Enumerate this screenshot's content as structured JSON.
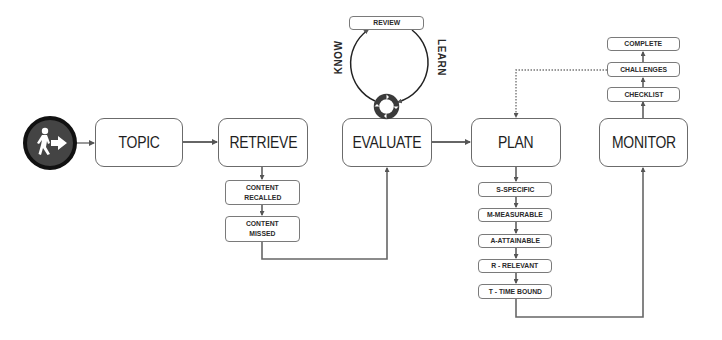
{
  "diagram": {
    "start": {
      "icon": "person-walking-exit-icon"
    },
    "main_steps": [
      {
        "id": "topic",
        "label": "TOPIC"
      },
      {
        "id": "retrieve",
        "label": "RETRIEVE"
      },
      {
        "id": "evaluate",
        "label": "EVALUATE"
      },
      {
        "id": "plan",
        "label": "PLAN"
      },
      {
        "id": "monitor",
        "label": "MONITOR"
      }
    ],
    "retrieve_substeps": [
      {
        "line1": "CONTENT",
        "line2": "RECALLED"
      },
      {
        "line1": "CONTENT",
        "line2": "MISSED"
      }
    ],
    "evaluate_cycle": {
      "top": "REVIEW",
      "left_arc": "KNOW",
      "right_arc": "LEARN",
      "icon": "cycle-icon"
    },
    "plan_substeps": [
      {
        "label": "S-SPECIFIC"
      },
      {
        "label": "M-MEASURABLE"
      },
      {
        "label": "A-ATTAINABLE"
      },
      {
        "label": "R - RELEVANT"
      },
      {
        "label": "T - TIME BOUND"
      }
    ],
    "monitor_substeps": [
      {
        "label": "CHECKLIST"
      },
      {
        "label": "CHALLENGES"
      },
      {
        "label": "COMPLETE"
      }
    ],
    "colors": {
      "stroke": "#6b6b6b",
      "start_ring": "#111111",
      "start_fill": "#444444"
    }
  }
}
